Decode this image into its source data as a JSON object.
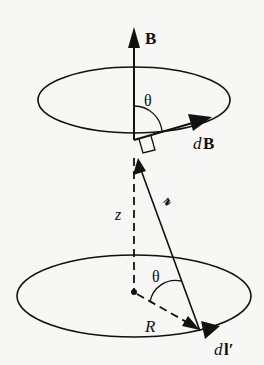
{
  "figure": {
    "labels": {
      "field": "B",
      "field_element_d": "d",
      "field_element_B": "B",
      "angle_top": "θ",
      "angle_bottom": "θ",
      "separation": "𝓇",
      "height": "z",
      "radius": "R",
      "current_element_d": "d",
      "current_element_l": "l′"
    },
    "colors": {
      "ink": "#111111",
      "paper": "#f7f7f5"
    }
  }
}
